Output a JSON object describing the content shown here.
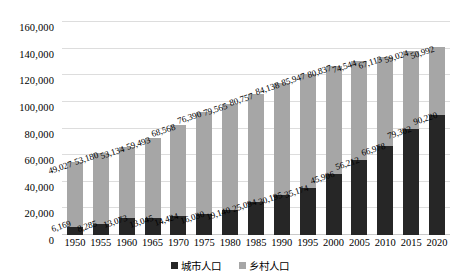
{
  "chart_data": {
    "type": "bar",
    "title": "",
    "subtitle": "",
    "xlabel": "",
    "ylabel": "",
    "stacked": true,
    "grid": true,
    "legend_position": "bottom",
    "ylim": [
      0,
      160000
    ],
    "yticks": [
      "0",
      "20,000",
      "40,000",
      "60,000",
      "80,000",
      "100,000",
      "120,000",
      "140,000",
      "160,000"
    ],
    "ytick_values": [
      0,
      20000,
      40000,
      60000,
      80000,
      100000,
      120000,
      140000,
      160000
    ],
    "categories": [
      "1950",
      "1955",
      "1960",
      "1965",
      "1970",
      "1975",
      "1980",
      "1985",
      "1990",
      "1995",
      "2000",
      "2005",
      "2010",
      "2015",
      "2020"
    ],
    "series": [
      {
        "name": "城市人口",
        "color": "#262626",
        "values": [
          6169,
          8285,
          13073,
          13045,
          14424,
          16030,
          19140,
          25094,
          30195,
          35174,
          45906,
          56212,
          66978,
          79302,
          90220
        ],
        "labels": [
          "6,169",
          "8,285",
          "13,073",
          "13,045",
          "14,424",
          "16,030",
          "19,140",
          "25,094",
          "30,195",
          "35,174",
          "45,906",
          "56,212",
          "66,978",
          "79,302",
          "90,220"
        ]
      },
      {
        "name": "乡村人口",
        "color": "#a6a6a6",
        "values": [
          49027,
          53180,
          53134,
          59493,
          68568,
          76390,
          79565,
          80757,
          84138,
          85947,
          80837,
          74544,
          67113,
          59024,
          50992
        ],
        "labels": [
          "49,027",
          "53,180",
          "53,134",
          "59,493",
          "68,568",
          "76,390",
          "79,565",
          "80,757",
          "84,138",
          "85,947",
          "80,837",
          "74,544",
          "67,113",
          "59,024",
          "50,992"
        ]
      }
    ]
  },
  "legend": {
    "items": [
      {
        "label": "城市人口",
        "color": "#262626"
      },
      {
        "label": "乡村人口",
        "color": "#a6a6a6"
      }
    ]
  },
  "colors": {
    "urban": "#262626",
    "rural": "#a6a6a6",
    "grid": "#dddddd",
    "background": "#ffffff",
    "text": "#000000"
  }
}
